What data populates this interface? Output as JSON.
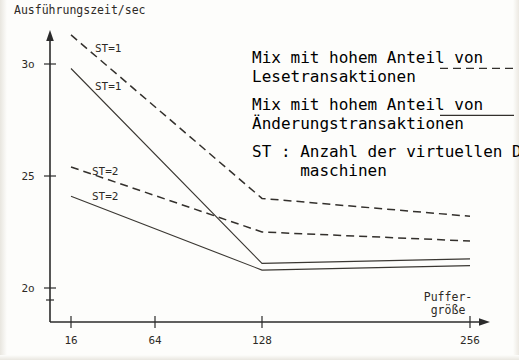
{
  "chart_data": {
    "type": "line",
    "title": "",
    "xlabel": "Puffergröße",
    "ylabel": "Ausführungszeit/sec",
    "x_tick_labels": [
      "16",
      "64",
      "128",
      "256"
    ],
    "x_tick_values": [
      16,
      64,
      128,
      256
    ],
    "y_tick_labels": [
      "3o",
      "25",
      "2o"
    ],
    "y_tick_values": [
      30,
      25,
      20
    ],
    "ylim": [
      19.2,
      31.9
    ],
    "xlim_px": [
      50,
      480
    ],
    "grid": false,
    "legend_position": "upper-right",
    "series": [
      {
        "name": "Mix mit hohem Anteil von Lesetransaktionen, ST=1",
        "style": "dashed",
        "annotation": "ST=1",
        "x": [
          16,
          128,
          256
        ],
        "values": [
          31.3,
          24.0,
          23.2
        ]
      },
      {
        "name": "Mix mit hohem Anteil von Änderungstransaktionen, ST=1",
        "style": "solid",
        "annotation": "ST=1",
        "x": [
          16,
          128,
          256
        ],
        "values": [
          29.8,
          21.1,
          21.3
        ]
      },
      {
        "name": "Mix mit hohem Anteil von Lesetransaktionen, ST=2",
        "style": "dashed",
        "annotation": "ST=2",
        "x": [
          16,
          128,
          256
        ],
        "values": [
          25.4,
          22.5,
          22.1
        ]
      },
      {
        "name": "Mix mit hohem Anteil von Änderungstransaktionen, ST=2",
        "style": "solid",
        "annotation": "ST=2",
        "x": [
          16,
          128,
          256
        ],
        "values": [
          24.1,
          20.8,
          21.0
        ]
      }
    ],
    "series_annotations": [
      {
        "label": "ST=1",
        "x_px": 95,
        "y_px": 52
      },
      {
        "label": "ST=1",
        "x_px": 95,
        "y_px": 90
      },
      {
        "label": "ST=2",
        "x_px": 92,
        "y_px": 175
      },
      {
        "label": "ST=2",
        "x_px": 92,
        "y_px": 200
      }
    ]
  },
  "axes": {
    "y_axis_title": "Ausführungszeit/sec",
    "x_axis_title_line1": "Puffer-",
    "x_axis_title_line2": "größe",
    "y_ticks": [
      {
        "label": "3o",
        "y_px": 64
      },
      {
        "label": "25",
        "y_px": 176
      },
      {
        "label": "2o",
        "y_px": 288
      }
    ],
    "x_ticks": [
      {
        "label": "16",
        "x_px": 71
      },
      {
        "label": "64",
        "x_px": 155
      },
      {
        "label": "128",
        "x_px": 262
      },
      {
        "label": "256",
        "x_px": 470
      }
    ]
  },
  "legend": {
    "entries": [
      {
        "line1": "Mix mit hohem Anteil von",
        "line2": "Lesetransaktionen",
        "style": "dashed"
      },
      {
        "line1": "Mix mit hohem Anteil von",
        "line2": "Änderungstransaktionen",
        "style": "solid"
      }
    ],
    "note_line1": "ST : Anzahl der virtuellen Datenbank-",
    "note_line2": "     maschinen"
  },
  "colors": {
    "ink": "#2d2a26",
    "paper": "#fdfdfb",
    "curve": "#33302c"
  }
}
